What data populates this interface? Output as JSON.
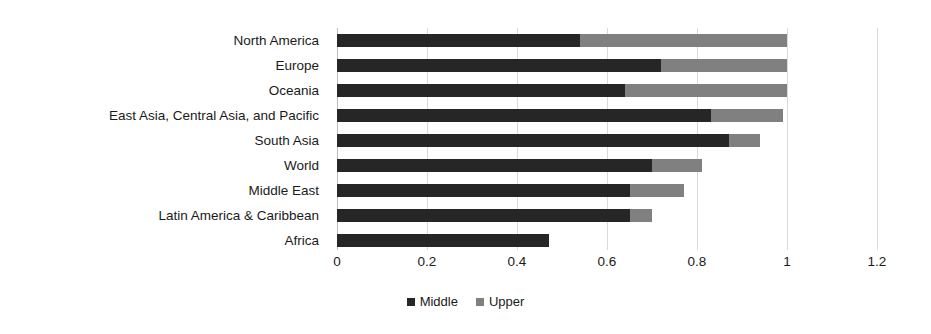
{
  "chart_data": {
    "type": "bar",
    "orientation": "horizontal",
    "stacked": true,
    "title": "",
    "xlabel": "",
    "ylabel": "",
    "xlim": [
      0,
      1.2
    ],
    "xticks": [
      "0",
      "0.2",
      "0.4",
      "0.6",
      "0.8",
      "1",
      "1.2"
    ],
    "xtick_values": [
      0,
      0.2,
      0.4,
      0.6,
      0.8,
      1,
      1.2
    ],
    "grid": true,
    "legend_position": "bottom",
    "categories": [
      "North America",
      "Europe",
      "Oceania",
      "East Asia, Central Asia, and Pacific",
      "South Asia",
      "World",
      "Middle East",
      "Latin America & Caribbean",
      "Africa"
    ],
    "series": [
      {
        "name": "Middle",
        "color": "#262626",
        "values": [
          0.54,
          0.72,
          0.64,
          0.83,
          0.87,
          0.7,
          0.65,
          0.65,
          0.47
        ]
      },
      {
        "name": "Upper",
        "color": "#808080",
        "values": [
          0.46,
          0.28,
          0.36,
          0.16,
          0.07,
          0.11,
          0.12,
          0.05,
          0.0
        ]
      }
    ],
    "totals": [
      1.0,
      1.0,
      1.0,
      0.99,
      0.94,
      0.81,
      0.77,
      0.7,
      0.47
    ]
  },
  "legend": {
    "items": [
      {
        "label": "Middle",
        "color": "#262626"
      },
      {
        "label": "Upper",
        "color": "#808080"
      }
    ]
  },
  "colors": {
    "middle": "#262626",
    "upper": "#808080",
    "gridline": "#d9d9d9",
    "axis": "#bfbfbf",
    "text": "#1a1a1a",
    "background": "#ffffff"
  }
}
